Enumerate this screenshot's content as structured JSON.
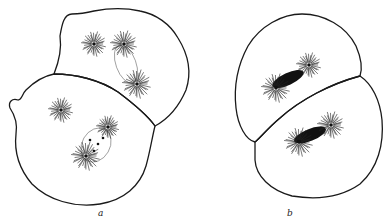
{
  "figure": {
    "panels": [
      {
        "label": "a",
        "description": "Two adjacent cells, each with two asters and a spindle between them",
        "cells": 2,
        "asters_per_cell": 2
      },
      {
        "label": "b",
        "description": "Two adjacent cells, each with a dense spindle/chromosome mass flanked by asters",
        "cells": 2,
        "asters_per_cell": 2
      }
    ],
    "colors": {
      "line": "#1a1a1a",
      "background": "#ffffff"
    }
  }
}
